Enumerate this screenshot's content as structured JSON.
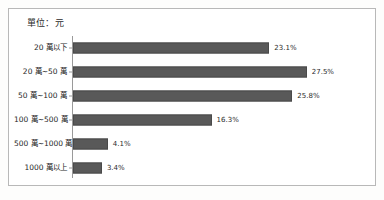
{
  "chart_data": {
    "type": "bar",
    "orientation": "horizontal",
    "title": "單位：元",
    "xlabel": "",
    "ylabel": "",
    "grid": false,
    "legend": false,
    "xlim": [
      0,
      30
    ],
    "value_suffix": "%",
    "categories": [
      "20 萬以下",
      "20 萬~50 萬",
      "50 萬~100 萬",
      "100 萬~500 萬",
      "500 萬~1000 萬",
      "1000 萬以上"
    ],
    "values": [
      23.1,
      27.5,
      25.8,
      16.3,
      4.1,
      3.4
    ],
    "value_labels": [
      "23.1%",
      "27.5%",
      "25.8%",
      "16.3%",
      "4.1%",
      "3.4%"
    ],
    "bar_color": "#595959",
    "border_color": "#b8b8b8",
    "axis_color": "#9a9a9a",
    "background_color": "#ffffff"
  }
}
